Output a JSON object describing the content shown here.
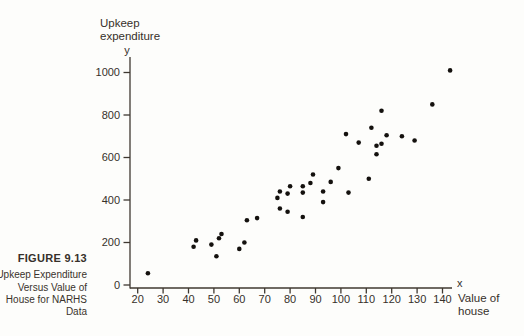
{
  "figure": {
    "label": "FIGURE 9.13",
    "caption_lines": [
      "Upkeep Expenditure",
      "Versus Value of",
      "House for NARHS",
      "Data"
    ]
  },
  "chart_data": {
    "type": "scatter",
    "title_lines": [
      "Upkeep",
      "expenditure"
    ],
    "y_axis_symbol": "y",
    "x_axis_symbol": "x",
    "x_label_lines": [
      "Value of",
      "house"
    ],
    "x_ticks": [
      20,
      30,
      40,
      50,
      60,
      70,
      80,
      90,
      100,
      110,
      120,
      130,
      140
    ],
    "y_ticks": [
      0,
      200,
      400,
      600,
      800,
      1000
    ],
    "xlim": [
      20,
      144
    ],
    "ylim": [
      0,
      1070
    ],
    "grid": false,
    "legend": "none",
    "n_points": 40,
    "xlabel": "Value of house",
    "ylabel": "Upkeep expenditure",
    "points": [
      [
        24,
        55
      ],
      [
        42,
        180
      ],
      [
        43,
        210
      ],
      [
        49,
        190
      ],
      [
        51,
        135
      ],
      [
        52,
        220
      ],
      [
        53,
        240
      ],
      [
        60,
        170
      ],
      [
        62,
        200
      ],
      [
        63,
        305
      ],
      [
        67,
        315
      ],
      [
        75,
        410
      ],
      [
        76,
        360
      ],
      [
        76,
        440
      ],
      [
        79,
        345
      ],
      [
        79,
        430
      ],
      [
        80,
        465
      ],
      [
        85,
        320
      ],
      [
        85,
        435
      ],
      [
        85,
        465
      ],
      [
        88,
        480
      ],
      [
        89,
        520
      ],
      [
        93,
        390
      ],
      [
        93,
        440
      ],
      [
        96,
        485
      ],
      [
        99,
        550
      ],
      [
        102,
        710
      ],
      [
        103,
        435
      ],
      [
        107,
        670
      ],
      [
        111,
        500
      ],
      [
        112,
        740
      ],
      [
        114,
        615
      ],
      [
        114,
        655
      ],
      [
        116,
        665
      ],
      [
        116,
        820
      ],
      [
        118,
        705
      ],
      [
        124,
        700
      ],
      [
        129,
        680
      ],
      [
        136,
        850
      ],
      [
        143,
        1010
      ]
    ]
  },
  "colors": {
    "ink": "#36302a",
    "axis": "#3f3830",
    "dot": "#14110e",
    "background": "#fdfdfb"
  }
}
